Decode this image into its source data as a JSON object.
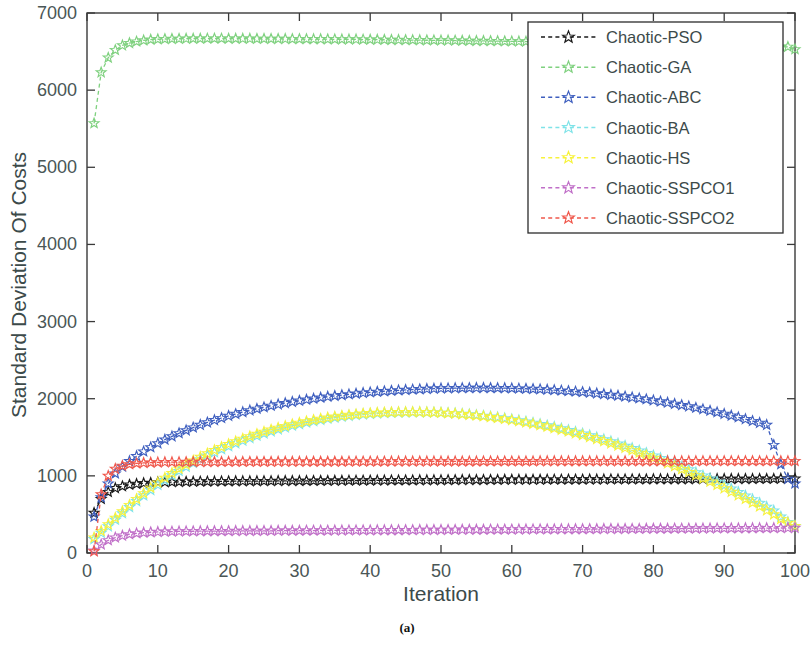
{
  "figure": {
    "caption": "(a)"
  },
  "chart_data": {
    "type": "line",
    "title": "",
    "xlabel": "Iteration",
    "ylabel": "Standard Deviation Of Costs",
    "xlim": [
      0,
      100
    ],
    "ylim": [
      0,
      7000
    ],
    "xticks": [
      0,
      10,
      20,
      30,
      40,
      50,
      60,
      70,
      80,
      90,
      100
    ],
    "yticks": [
      0,
      1000,
      2000,
      3000,
      4000,
      5000,
      6000,
      7000
    ],
    "xtick_labels": [
      "0",
      "10",
      "20",
      "30",
      "40",
      "50",
      "60",
      "70",
      "80",
      "90",
      "100"
    ],
    "ytick_labels": [
      "0",
      "1000",
      "2000",
      "3000",
      "4000",
      "5000",
      "6000",
      "7000"
    ],
    "grid": false,
    "legend_position": "top-right",
    "marker": "star",
    "linestyle": "dashed",
    "x": [
      1,
      2,
      3,
      4,
      5,
      6,
      7,
      8,
      9,
      10,
      11,
      12,
      13,
      14,
      15,
      16,
      17,
      18,
      19,
      20,
      21,
      22,
      23,
      24,
      25,
      26,
      27,
      28,
      29,
      30,
      31,
      32,
      33,
      34,
      35,
      36,
      37,
      38,
      39,
      40,
      41,
      42,
      43,
      44,
      45,
      46,
      47,
      48,
      49,
      50,
      51,
      52,
      53,
      54,
      55,
      56,
      57,
      58,
      59,
      60,
      61,
      62,
      63,
      64,
      65,
      66,
      67,
      68,
      69,
      70,
      71,
      72,
      73,
      74,
      75,
      76,
      77,
      78,
      79,
      80,
      81,
      82,
      83,
      84,
      85,
      86,
      87,
      88,
      89,
      90,
      91,
      92,
      93,
      94,
      95,
      96,
      97,
      98,
      99,
      100
    ],
    "series": [
      {
        "name": "Chaotic-PSO",
        "color": "#1a1a1a",
        "values": [
          520,
          700,
          790,
          840,
          865,
          885,
          895,
          905,
          910,
          915,
          918,
          920,
          922,
          924,
          925,
          926,
          927,
          928,
          929,
          930,
          931,
          931,
          932,
          932,
          933,
          933,
          934,
          934,
          935,
          935,
          936,
          936,
          937,
          937,
          938,
          938,
          939,
          939,
          940,
          940,
          941,
          941,
          942,
          942,
          943,
          943,
          944,
          944,
          945,
          945,
          946,
          946,
          947,
          947,
          948,
          948,
          949,
          949,
          950,
          950,
          950,
          951,
          951,
          951,
          952,
          952,
          952,
          953,
          953,
          953,
          954,
          954,
          954,
          955,
          955,
          955,
          956,
          956,
          956,
          957,
          957,
          957,
          958,
          958,
          958,
          959,
          959,
          959,
          960,
          960,
          960,
          961,
          961,
          961,
          962,
          962,
          962,
          963,
          963,
          963
        ]
      },
      {
        "name": "Chaotic-GA",
        "color": "#7fd17f",
        "values": [
          5570,
          6230,
          6420,
          6520,
          6580,
          6610,
          6630,
          6645,
          6655,
          6660,
          6663,
          6665,
          6666,
          6667,
          6668,
          6668,
          6669,
          6669,
          6669,
          6668,
          6668,
          6667,
          6667,
          6666,
          6666,
          6665,
          6665,
          6664,
          6663,
          6663,
          6662,
          6661,
          6661,
          6660,
          6659,
          6658,
          6658,
          6657,
          6656,
          6655,
          6654,
          6653,
          6652,
          6651,
          6650,
          6649,
          6648,
          6647,
          6646,
          6645,
          6644,
          6643,
          6642,
          6640,
          6639,
          6638,
          6637,
          6636,
          6634,
          6633,
          6632,
          6630,
          6629,
          6628,
          6626,
          6625,
          6623,
          6622,
          6620,
          6619,
          6617,
          6616,
          6614,
          6612,
          6611,
          6609,
          6607,
          6606,
          6604,
          6602,
          6600,
          6598,
          6596,
          6595,
          6593,
          6591,
          6589,
          6587,
          6585,
          6583,
          6581,
          6578,
          6576,
          6574,
          6572,
          6569,
          6567,
          6564,
          6562,
          6530
        ]
      },
      {
        "name": "Chaotic-ABC",
        "color": "#3f5fbf",
        "values": [
          470,
          720,
          900,
          1030,
          1120,
          1190,
          1255,
          1315,
          1370,
          1420,
          1470,
          1512,
          1552,
          1590,
          1626,
          1660,
          1692,
          1722,
          1750,
          1777,
          1802,
          1826,
          1848,
          1869,
          1889,
          1908,
          1926,
          1943,
          1959,
          1974,
          1988,
          2001,
          2014,
          2026,
          2037,
          2047,
          2057,
          2066,
          2075,
          2083,
          2090,
          2097,
          2103,
          2109,
          2114,
          2119,
          2123,
          2127,
          2130,
          2133,
          2135,
          2137,
          2138,
          2139,
          2140,
          2140,
          2139,
          2138,
          2137,
          2135,
          2132,
          2129,
          2126,
          2122,
          2117,
          2112,
          2106,
          2100,
          2093,
          2086,
          2078,
          2069,
          2060,
          2050,
          2040,
          2029,
          2017,
          2005,
          1992,
          1978,
          1964,
          1949,
          1933,
          1917,
          1900,
          1882,
          1863,
          1844,
          1824,
          1803,
          1781,
          1759,
          1735,
          1711,
          1686,
          1660,
          1400,
          1150,
          960,
          900
        ]
      },
      {
        "name": "Chaotic-BA",
        "color": "#7fe3e8",
        "values": [
          180,
          260,
          345,
          430,
          515,
          595,
          672,
          745,
          815,
          882,
          945,
          1005,
          1062,
          1116,
          1167,
          1215,
          1261,
          1304,
          1345,
          1384,
          1421,
          1456,
          1489,
          1520,
          1549,
          1577,
          1603,
          1627,
          1650,
          1671,
          1691,
          1709,
          1726,
          1741,
          1755,
          1767,
          1778,
          1788,
          1796,
          1803,
          1809,
          1814,
          1818,
          1821,
          1823,
          1824,
          1824,
          1823,
          1821,
          1818,
          1814,
          1809,
          1803,
          1796,
          1788,
          1779,
          1769,
          1758,
          1746,
          1733,
          1719,
          1704,
          1688,
          1671,
          1653,
          1634,
          1614,
          1593,
          1571,
          1548,
          1524,
          1499,
          1473,
          1446,
          1418,
          1389,
          1359,
          1328,
          1296,
          1263,
          1229,
          1194,
          1158,
          1121,
          1083,
          1044,
          1004,
          963,
          921,
          878,
          834,
          789,
          743,
          696,
          648,
          599,
          549,
          470,
          400,
          350
        ]
      },
      {
        "name": "Chaotic-HS",
        "color": "#f7f23c",
        "values": [
          200,
          285,
          370,
          455,
          540,
          622,
          700,
          774,
          845,
          912,
          975,
          1035,
          1092,
          1146,
          1197,
          1245,
          1290,
          1333,
          1373,
          1411,
          1447,
          1481,
          1513,
          1543,
          1571,
          1598,
          1623,
          1646,
          1668,
          1688,
          1707,
          1724,
          1740,
          1754,
          1767,
          1779,
          1789,
          1798,
          1806,
          1812,
          1817,
          1821,
          1824,
          1826,
          1827,
          1827,
          1826,
          1824,
          1821,
          1817,
          1812,
          1806,
          1799,
          1791,
          1782,
          1772,
          1761,
          1749,
          1736,
          1722,
          1707,
          1691,
          1674,
          1656,
          1637,
          1617,
          1596,
          1574,
          1551,
          1527,
          1502,
          1476,
          1449,
          1421,
          1392,
          1362,
          1331,
          1299,
          1266,
          1232,
          1197,
          1161,
          1124,
          1086,
          1047,
          1007,
          966,
          924,
          881,
          837,
          792,
          746,
          699,
          651,
          602,
          552,
          501,
          440,
          390,
          350
        ]
      },
      {
        "name": "Chaotic-SSPCO1",
        "color": "#c06fc8",
        "values": [
          30,
          110,
          165,
          200,
          225,
          243,
          255,
          263,
          269,
          273,
          276,
          278,
          280,
          281,
          282,
          283,
          284,
          284,
          285,
          285,
          286,
          286,
          287,
          287,
          288,
          288,
          289,
          289,
          290,
          290,
          291,
          291,
          292,
          292,
          293,
          293,
          294,
          294,
          295,
          295,
          296,
          296,
          297,
          297,
          298,
          298,
          299,
          299,
          300,
          300,
          301,
          301,
          302,
          302,
          303,
          303,
          304,
          304,
          305,
          305,
          306,
          306,
          307,
          307,
          308,
          308,
          309,
          309,
          310,
          310,
          311,
          311,
          312,
          312,
          313,
          313,
          314,
          314,
          315,
          315,
          316,
          316,
          317,
          317,
          318,
          318,
          319,
          319,
          320,
          320,
          321,
          321,
          322,
          322,
          323,
          323,
          324,
          324,
          325,
          325
        ]
      },
      {
        "name": "Chaotic-SSPCO2",
        "color": "#f0584c",
        "values": [
          20,
          760,
          1000,
          1090,
          1130,
          1150,
          1162,
          1168,
          1172,
          1175,
          1177,
          1178,
          1179,
          1180,
          1180,
          1181,
          1181,
          1181,
          1182,
          1182,
          1182,
          1182,
          1183,
          1183,
          1183,
          1183,
          1184,
          1184,
          1184,
          1184,
          1184,
          1185,
          1185,
          1185,
          1185,
          1185,
          1186,
          1186,
          1186,
          1186,
          1186,
          1186,
          1187,
          1187,
          1187,
          1187,
          1187,
          1187,
          1188,
          1188,
          1188,
          1188,
          1188,
          1188,
          1188,
          1189,
          1189,
          1189,
          1189,
          1189,
          1189,
          1189,
          1189,
          1190,
          1190,
          1190,
          1190,
          1190,
          1190,
          1190,
          1190,
          1190,
          1190,
          1191,
          1191,
          1191,
          1191,
          1191,
          1191,
          1191,
          1191,
          1191,
          1191,
          1191,
          1191,
          1192,
          1192,
          1192,
          1192,
          1192,
          1192,
          1192,
          1192,
          1192,
          1192,
          1192,
          1192,
          1192,
          1192,
          1192
        ]
      }
    ]
  },
  "legend": {
    "entries": [
      {
        "label": "Chaotic-PSO",
        "color": "#1a1a1a"
      },
      {
        "label": "Chaotic-GA",
        "color": "#7fd17f"
      },
      {
        "label": "Chaotic-ABC",
        "color": "#3f5fbf"
      },
      {
        "label": "Chaotic-BA",
        "color": "#7fe3e8"
      },
      {
        "label": "Chaotic-HS",
        "color": "#f7f23c"
      },
      {
        "label": "Chaotic-SSPCO1",
        "color": "#c06fc8"
      },
      {
        "label": "Chaotic-SSPCO2",
        "color": "#f0584c"
      }
    ]
  }
}
